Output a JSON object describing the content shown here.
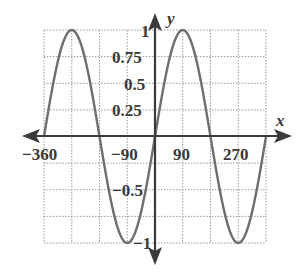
{
  "chart_data": {
    "type": "line",
    "title": "",
    "xlabel": "x",
    "ylabel": "y",
    "xlim": [
      -360,
      360
    ],
    "ylim": [
      -1,
      1
    ],
    "grid": true,
    "grid_x_step": 90,
    "grid_y_step": 0.25,
    "x_tick_labels": [
      "-360",
      "-90",
      "90",
      "270"
    ],
    "y_tick_labels": [
      "1",
      "0.75",
      "0.5",
      "0.25",
      "-0.5",
      "-1"
    ],
    "series": [
      {
        "name": "y = sin x",
        "x": [
          -360,
          -315,
          -270,
          -225,
          -180,
          -135,
          -90,
          -45,
          0,
          45,
          90,
          135,
          180,
          225,
          270,
          315,
          360
        ],
        "values": [
          0,
          0.71,
          1,
          0.71,
          0,
          -0.71,
          -1,
          -0.71,
          0,
          0.71,
          1,
          0.71,
          0,
          -0.71,
          -1,
          -0.71,
          0
        ]
      }
    ],
    "colors": {
      "curve": "#6e6e6e",
      "axes": "#3a3a3a",
      "grid": "#9a9a9a"
    }
  }
}
